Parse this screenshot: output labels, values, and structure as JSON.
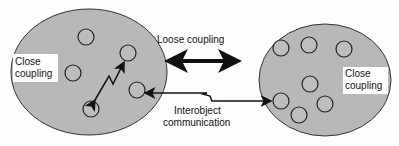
{
  "diagram": {
    "left_group_label_line1": "Close",
    "left_group_label_line2": "coupling",
    "right_group_label_line1": "Close",
    "right_group_label_line2": "coupling",
    "loose_coupling_label": "Loose coupling",
    "interobject_label_line1": "Interobject",
    "interobject_label_line2": "communication",
    "colors": {
      "group_fill": "#b8b8b8",
      "object_fill": "#bdbdbd",
      "stroke": "#1a1a1a",
      "label_bg": "#ffffff"
    }
  }
}
